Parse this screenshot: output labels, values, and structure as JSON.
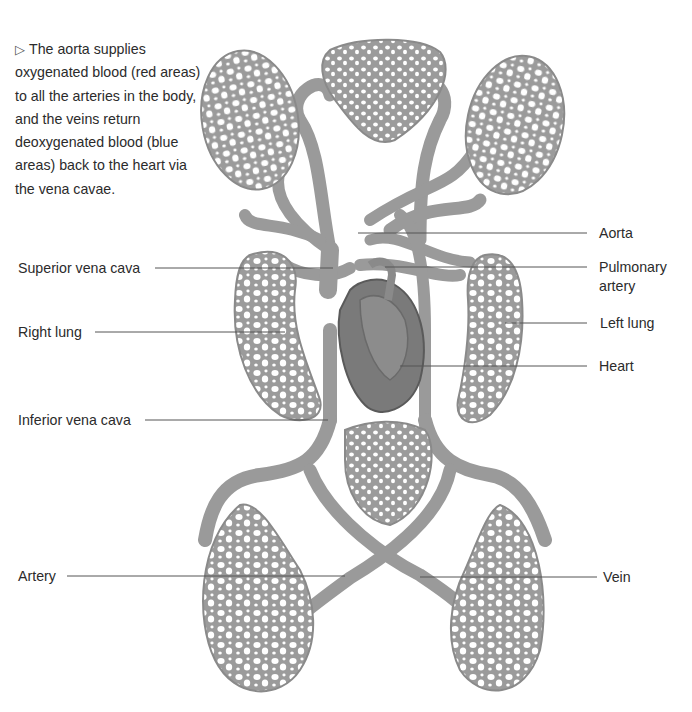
{
  "caption": {
    "marker": "▷",
    "text": "The aorta supplies oxygenated blood (red areas) to all the arteries in the body, and the veins return deoxygenated blood (blue areas) back to the heart via the vena cavae."
  },
  "labels": {
    "left": [
      {
        "id": "superior-vena-cava",
        "text": "Superior vena cava"
      },
      {
        "id": "right-lung",
        "text": "Right lung"
      },
      {
        "id": "inferior-vena-cava",
        "text": "Inferior vena cava"
      },
      {
        "id": "artery",
        "text": "Artery"
      }
    ],
    "right": [
      {
        "id": "aorta",
        "text": "Aorta"
      },
      {
        "id": "pulmonary-artery",
        "text": "Pulmonary artery"
      },
      {
        "id": "left-lung",
        "text": "Left lung"
      },
      {
        "id": "heart",
        "text": "Heart"
      },
      {
        "id": "vein",
        "text": "Vein"
      }
    ]
  },
  "colors": {
    "vessel": "#9a9a9a",
    "vessel_dark": "#7a7a7a",
    "heart": "#6f6f6f",
    "leader_line": "#555555",
    "background": "#ffffff"
  }
}
